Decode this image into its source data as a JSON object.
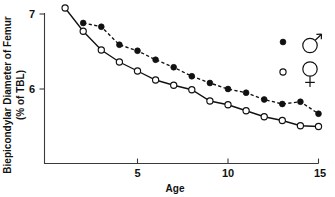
{
  "chart_data": {
    "type": "line",
    "title": "",
    "xlabel": "Age",
    "ylabel": "Biepicondylar Diameter of Femur (% of TBL)",
    "ylabel_line1": "Biepicondylar Diameter of Femur",
    "ylabel_line2": "(% of TBL)",
    "x": [
      1,
      2,
      3,
      4,
      5,
      6,
      7,
      8,
      9,
      10,
      11,
      12,
      13,
      14,
      15
    ],
    "xlim": [
      0.6,
      15.4
    ],
    "ylim": [
      5.32,
      7.15
    ],
    "xticks": [
      5,
      10,
      15
    ],
    "xtick_labels": [
      "5",
      "10",
      "15"
    ],
    "yticks": [
      6,
      7
    ],
    "ytick_labels": [
      "6",
      "7"
    ],
    "grid": false,
    "legend_position": "upper-right-inside",
    "series": [
      {
        "name": "male",
        "symbol": "filled-circle",
        "legend_glyph": "mars-symbol",
        "legend_label": "♂",
        "linestyle": "dashed",
        "x": [
          2,
          3,
          4,
          5,
          6,
          7,
          8,
          9,
          10,
          11,
          12,
          13,
          14,
          15
        ],
        "values": [
          6.88,
          6.83,
          6.59,
          6.51,
          6.39,
          6.29,
          6.17,
          6.08,
          6.0,
          5.95,
          5.86,
          5.8,
          5.83,
          5.67
        ]
      },
      {
        "name": "female",
        "symbol": "open-circle",
        "legend_glyph": "venus-symbol",
        "legend_label": "♀",
        "linestyle": "solid",
        "x": [
          1,
          2,
          3,
          4,
          5,
          6,
          7,
          8,
          9,
          10,
          11,
          12,
          13,
          14,
          15
        ],
        "values": [
          7.08,
          6.77,
          6.52,
          6.36,
          6.24,
          6.12,
          6.05,
          5.99,
          5.84,
          5.79,
          5.71,
          5.63,
          5.58,
          5.51,
          5.5
        ]
      }
    ],
    "colors": {
      "ink": "#111111",
      "axis": "#3a3a3a",
      "background": "#ffffff"
    }
  }
}
